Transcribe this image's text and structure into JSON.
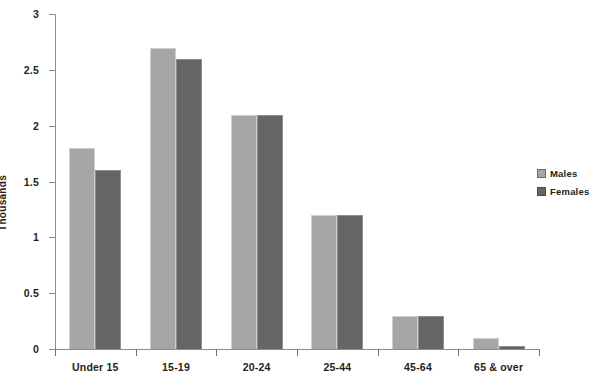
{
  "chart_data": {
    "type": "bar",
    "title": "",
    "subtitle": "",
    "xlabel": "",
    "ylabel": "Thousands",
    "ylim": [
      0,
      3
    ],
    "ytick_labels": [
      "0",
      "0.5",
      "1",
      "1.5",
      "2",
      "2.5",
      "3"
    ],
    "ytick_values": [
      0,
      0.5,
      1,
      1.5,
      2,
      2.5,
      3
    ],
    "grid": false,
    "legend_position": "right",
    "categories": [
      "Under 15",
      "15-19",
      "20-24",
      "25-44",
      "45-64",
      "65 & over"
    ],
    "series": [
      {
        "name": "Males",
        "color": "#a6a6a6",
        "values": [
          1.8,
          2.7,
          2.1,
          1.2,
          0.3,
          0.1
        ]
      },
      {
        "name": "Females",
        "color": "#656565",
        "values": [
          1.6,
          2.6,
          2.1,
          1.2,
          0.3,
          0.03
        ]
      }
    ]
  },
  "legend": {
    "items": [
      {
        "label": "Males",
        "swatch": "males"
      },
      {
        "label": "Females",
        "swatch": "females"
      }
    ]
  },
  "axes": {
    "y_title": "Thousands"
  }
}
